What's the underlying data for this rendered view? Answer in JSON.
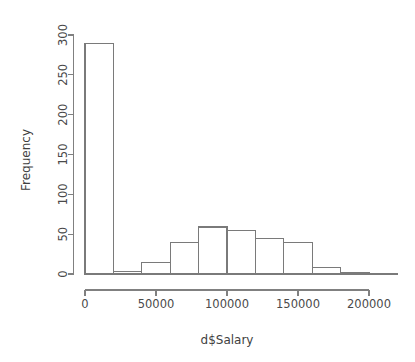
{
  "chart_data": {
    "type": "bar",
    "subtype": "histogram",
    "title": "",
    "subtitle": "",
    "xlabel": "d$Salary",
    "ylabel": "Frequency",
    "xlim": [
      0,
      220000
    ],
    "ylim": [
      0,
      300
    ],
    "grid": false,
    "legend": null,
    "bin_width": 20000,
    "bin_edges": [
      0,
      20000,
      40000,
      60000,
      80000,
      100000,
      120000,
      140000,
      160000,
      180000,
      200000,
      220000
    ],
    "categories": [
      "0-20000",
      "20000-40000",
      "40000-60000",
      "60000-80000",
      "80000-100000",
      "100000-120000",
      "120000-140000",
      "140000-160000",
      "160000-180000",
      "180000-200000",
      "200000-220000"
    ],
    "values": [
      289,
      3,
      15,
      40,
      59,
      55,
      44,
      40,
      8,
      2,
      1
    ],
    "x_ticks": [
      0,
      50000,
      100000,
      150000,
      200000
    ],
    "x_tick_labels": [
      "0",
      "50000",
      "100000",
      "150000",
      "200000"
    ],
    "y_ticks": [
      0,
      50,
      100,
      150,
      200,
      250,
      300
    ],
    "y_tick_labels": [
      "0",
      "50",
      "100",
      "150",
      "200",
      "250",
      "300"
    ],
    "colors": {
      "bar_fill": "#ffffff",
      "bar_stroke": "#7a7a7a",
      "axis": "#808080",
      "text": "#4a4a4a",
      "background": "#ffffff"
    }
  },
  "axes": {
    "y_title": "Frequency",
    "x_title": "d$Salary"
  }
}
